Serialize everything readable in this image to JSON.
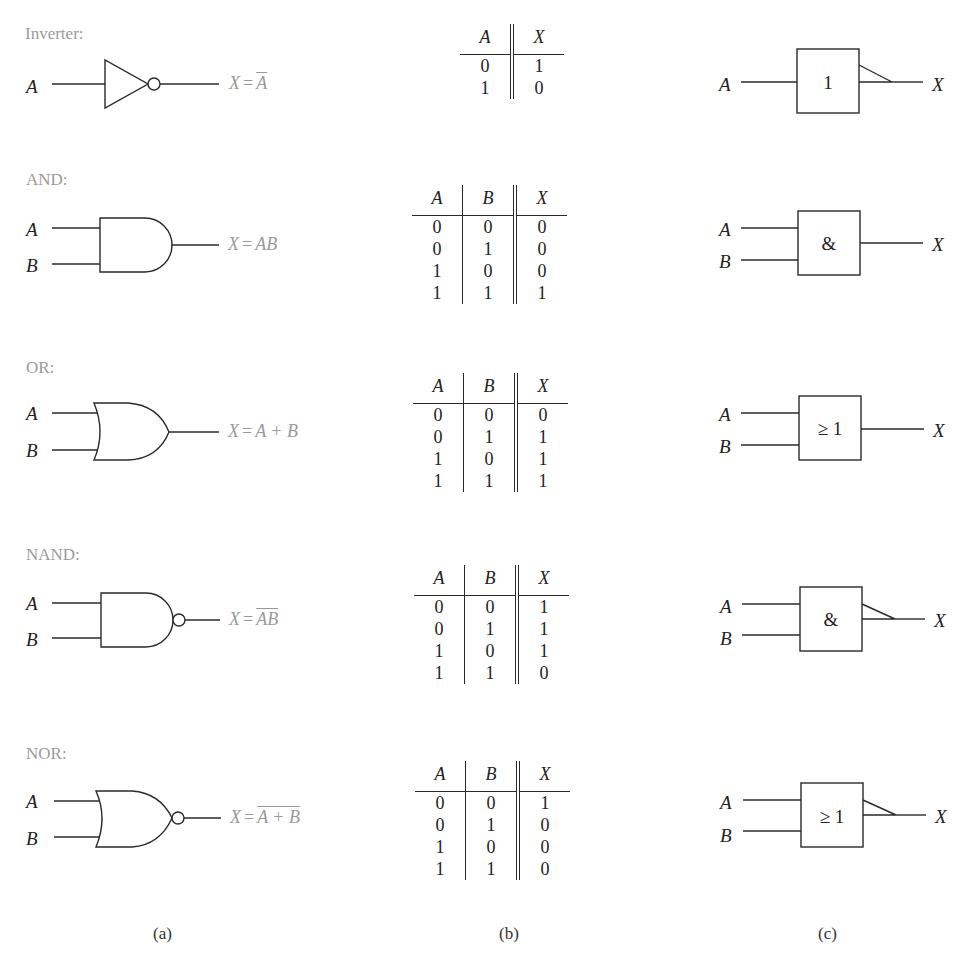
{
  "gates": [
    {
      "id": "inverter",
      "title": "Inverter:",
      "inputs": [
        "A"
      ],
      "output": "X",
      "expression": {
        "lhs": "X",
        "eq": "=",
        "rhs": "A",
        "overline": true
      },
      "iec_symbol": "1",
      "iec_negated": true,
      "truth_table": {
        "headers": [
          "A",
          "X"
        ],
        "rows": [
          [
            "0",
            "1"
          ],
          [
            "1",
            "0"
          ]
        ]
      }
    },
    {
      "id": "and",
      "title": "AND:",
      "inputs": [
        "A",
        "B"
      ],
      "output": "X",
      "expression": {
        "lhs": "X",
        "eq": "=",
        "rhs": "AB",
        "overline": false
      },
      "iec_symbol": "&",
      "iec_negated": false,
      "truth_table": {
        "headers": [
          "A",
          "B",
          "X"
        ],
        "rows": [
          [
            "0",
            "0",
            "0"
          ],
          [
            "0",
            "1",
            "0"
          ],
          [
            "1",
            "0",
            "0"
          ],
          [
            "1",
            "1",
            "1"
          ]
        ]
      }
    },
    {
      "id": "or",
      "title": "OR:",
      "inputs": [
        "A",
        "B"
      ],
      "output": "X",
      "expression": {
        "lhs": "X",
        "eq": "=",
        "rhs": "A + B",
        "overline": false
      },
      "iec_symbol": "≥ 1",
      "iec_negated": false,
      "truth_table": {
        "headers": [
          "A",
          "B",
          "X"
        ],
        "rows": [
          [
            "0",
            "0",
            "0"
          ],
          [
            "0",
            "1",
            "1"
          ],
          [
            "1",
            "0",
            "1"
          ],
          [
            "1",
            "1",
            "1"
          ]
        ]
      }
    },
    {
      "id": "nand",
      "title": "NAND:",
      "inputs": [
        "A",
        "B"
      ],
      "output": "X",
      "expression": {
        "lhs": "X",
        "eq": "=",
        "rhs": "AB",
        "overline": true
      },
      "iec_symbol": "&",
      "iec_negated": true,
      "truth_table": {
        "headers": [
          "A",
          "B",
          "X"
        ],
        "rows": [
          [
            "0",
            "0",
            "1"
          ],
          [
            "0",
            "1",
            "1"
          ],
          [
            "1",
            "0",
            "1"
          ],
          [
            "1",
            "1",
            "0"
          ]
        ]
      }
    },
    {
      "id": "nor",
      "title": "NOR:",
      "inputs": [
        "A",
        "B"
      ],
      "output": "X",
      "expression": {
        "lhs": "X",
        "eq": "=",
        "rhs": "A + B",
        "overline": true
      },
      "iec_symbol": "≥ 1",
      "iec_negated": true,
      "truth_table": {
        "headers": [
          "A",
          "B",
          "X"
        ],
        "rows": [
          [
            "0",
            "0",
            "1"
          ],
          [
            "0",
            "1",
            "0"
          ],
          [
            "1",
            "0",
            "0"
          ],
          [
            "1",
            "1",
            "0"
          ]
        ]
      }
    }
  ],
  "captions": {
    "a": "(a)",
    "b": "(b)",
    "c": "(c)"
  },
  "colors": {
    "line": "#2a2a2a",
    "muted_text": "#9a9a9a",
    "text": "#222222"
  }
}
